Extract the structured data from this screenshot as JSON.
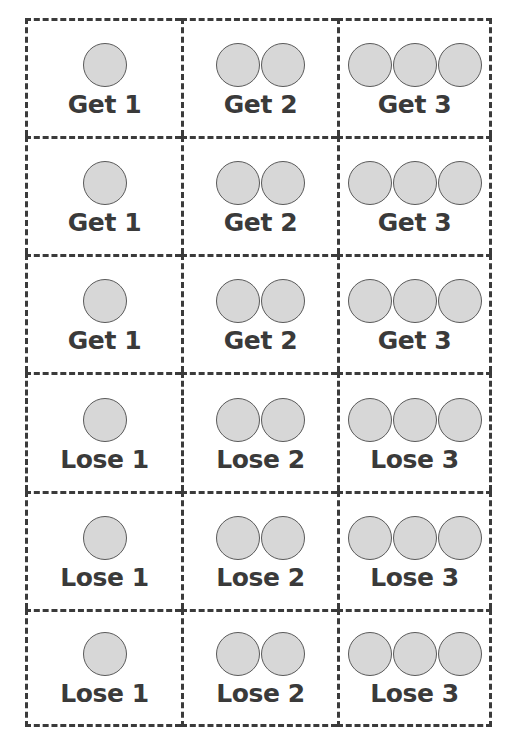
{
  "canvas": {
    "width": 513,
    "height": 744,
    "background_color": "#ffffff"
  },
  "style": {
    "border_color": "#3b3b3b",
    "token_fill_color": "#d7d7d7",
    "token_stroke_color": "#5a5a5a",
    "label_color": "#3a3a3a"
  },
  "grid": {
    "columns": 3,
    "rows": 6,
    "cells": [
      {
        "row": 1,
        "col": 1,
        "label": "Get 1",
        "token_count": 1,
        "token_icon": "circle-token-icon"
      },
      {
        "row": 1,
        "col": 2,
        "label": "Get 2",
        "token_count": 2,
        "token_icon": "circle-token-icon"
      },
      {
        "row": 1,
        "col": 3,
        "label": "Get 3",
        "token_count": 3,
        "token_icon": "circle-token-icon"
      },
      {
        "row": 2,
        "col": 1,
        "label": "Get 1",
        "token_count": 1,
        "token_icon": "circle-token-icon"
      },
      {
        "row": 2,
        "col": 2,
        "label": "Get 2",
        "token_count": 2,
        "token_icon": "circle-token-icon"
      },
      {
        "row": 2,
        "col": 3,
        "label": "Get 3",
        "token_count": 3,
        "token_icon": "circle-token-icon"
      },
      {
        "row": 3,
        "col": 1,
        "label": "Get 1",
        "token_count": 1,
        "token_icon": "circle-token-icon"
      },
      {
        "row": 3,
        "col": 2,
        "label": "Get 2",
        "token_count": 2,
        "token_icon": "circle-token-icon"
      },
      {
        "row": 3,
        "col": 3,
        "label": "Get 3",
        "token_count": 3,
        "token_icon": "circle-token-icon"
      },
      {
        "row": 4,
        "col": 1,
        "label": "Lose 1",
        "token_count": 1,
        "token_icon": "circle-token-icon"
      },
      {
        "row": 4,
        "col": 2,
        "label": "Lose 2",
        "token_count": 2,
        "token_icon": "circle-token-icon"
      },
      {
        "row": 4,
        "col": 3,
        "label": "Lose 3",
        "token_count": 3,
        "token_icon": "circle-token-icon"
      },
      {
        "row": 5,
        "col": 1,
        "label": "Lose 1",
        "token_count": 1,
        "token_icon": "circle-token-icon"
      },
      {
        "row": 5,
        "col": 2,
        "label": "Lose 2",
        "token_count": 2,
        "token_icon": "circle-token-icon"
      },
      {
        "row": 5,
        "col": 3,
        "label": "Lose 3",
        "token_count": 3,
        "token_icon": "circle-token-icon"
      },
      {
        "row": 6,
        "col": 1,
        "label": "Lose 1",
        "token_count": 1,
        "token_icon": "circle-token-icon"
      },
      {
        "row": 6,
        "col": 2,
        "label": "Lose 2",
        "token_count": 2,
        "token_icon": "circle-token-icon"
      },
      {
        "row": 6,
        "col": 3,
        "label": "Lose 3",
        "token_count": 3,
        "token_icon": "circle-token-icon"
      }
    ]
  }
}
